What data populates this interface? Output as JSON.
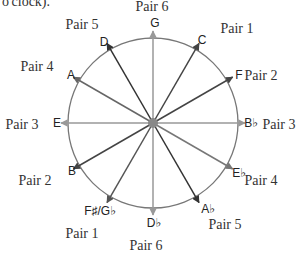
{
  "caption_fragment": "o'clock).",
  "circle": {
    "cx": 153,
    "cy": 123,
    "r": 85,
    "stroke": "#777777"
  },
  "center_dot": {
    "r": 5,
    "fill": "#888888"
  },
  "arrows": [
    {
      "note": "G",
      "angle": 0,
      "color": "#999999",
      "label_x": 155,
      "label_y": 27
    },
    {
      "note": "C",
      "angle": 30,
      "color": "#444444",
      "label_x": 202,
      "label_y": 44
    },
    {
      "note": "F",
      "angle": 60,
      "color": "#444444",
      "label_x": 239,
      "label_y": 79
    },
    {
      "note": "B♭",
      "angle": 90,
      "color": "#999999",
      "label_x": 251,
      "label_y": 127
    },
    {
      "note": "E♭",
      "angle": 120,
      "color": "#777777",
      "label_x": 239,
      "label_y": 177
    },
    {
      "note": "A♭",
      "angle": 150,
      "color": "#333333",
      "label_x": 208,
      "label_y": 213
    },
    {
      "note": "D♭",
      "angle": 180,
      "color": "#999999",
      "label_x": 154,
      "label_y": 227
    },
    {
      "note": "F♯/G♭",
      "angle": 210,
      "color": "#555555",
      "label_x": 100,
      "label_y": 215
    },
    {
      "note": "B",
      "angle": 240,
      "color": "#444444",
      "label_x": 72,
      "label_y": 175
    },
    {
      "note": "E",
      "angle": 270,
      "color": "#999999",
      "label_x": 57,
      "label_y": 127
    },
    {
      "note": "A",
      "angle": 300,
      "color": "#666666",
      "label_x": 71,
      "label_y": 79
    },
    {
      "note": "D",
      "angle": 330,
      "color": "#333333",
      "label_x": 104,
      "label_y": 46
    }
  ],
  "pair_labels": [
    {
      "text": "Pair 6",
      "x": 152,
      "y": 11
    },
    {
      "text": "Pair 5",
      "x": 82,
      "y": 29
    },
    {
      "text": "Pair 1",
      "x": 237,
      "y": 33
    },
    {
      "text": "Pair 4",
      "x": 37,
      "y": 71
    },
    {
      "text": "Pair 2",
      "x": 261,
      "y": 80
    },
    {
      "text": "Pair 3",
      "x": 22,
      "y": 129
    },
    {
      "text": "Pair 3",
      "x": 279,
      "y": 129
    },
    {
      "text": "Pair 2",
      "x": 35,
      "y": 185
    },
    {
      "text": "Pair 4",
      "x": 261,
      "y": 185
    },
    {
      "text": "Pair 5",
      "x": 225,
      "y": 229
    },
    {
      "text": "Pair 1",
      "x": 82,
      "y": 238
    },
    {
      "text": "Pair 6",
      "x": 146,
      "y": 250
    }
  ]
}
